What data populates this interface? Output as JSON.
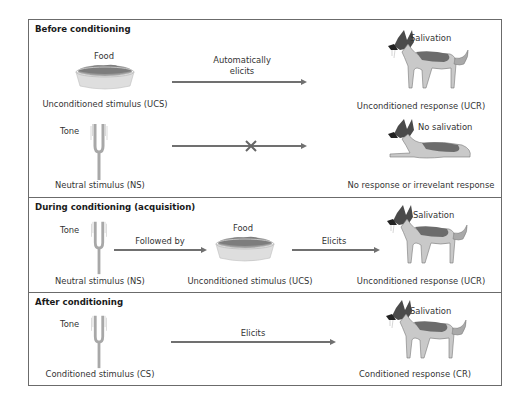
{
  "sections": [
    {
      "title": "Before conditioning",
      "rows": [
        {
          "stimulus_icon": "food-bowl-icon",
          "stimulus_caption": "Food",
          "stimulus_label": "Unconditioned stimulus (UCS)",
          "arrow_label_line1": "Automatically",
          "arrow_label_line2": "elicits",
          "response_icon": "standing-dog-salivating-icon",
          "response_caption": "Salivation",
          "response_label": "Unconditioned response (UCR)"
        },
        {
          "stimulus_icon": "tuning-fork-icon",
          "stimulus_caption": "Tone",
          "stimulus_label": "Neutral stimulus (NS)",
          "arrow_marker": "x-mark-icon",
          "response_icon": "lying-dog-icon",
          "response_caption": "No salivation",
          "response_label": "No response or irrevelant response"
        }
      ]
    },
    {
      "title": "During conditioning (acquisition)",
      "stimulus1_icon": "tuning-fork-icon",
      "stimulus1_caption": "Tone",
      "stimulus1_label": "Neutral stimulus (NS)",
      "arrow1_label": "Followed by",
      "stimulus2_icon": "food-bowl-icon",
      "stimulus2_caption": "Food",
      "stimulus2_label": "Unconditioned stimulus (UCS)",
      "arrow2_label": "Elicits",
      "response_icon": "standing-dog-salivating-icon",
      "response_caption": "Salivation",
      "response_label": "Unconditioned response (UCR)"
    },
    {
      "title": "After conditioning",
      "stimulus_icon": "tuning-fork-icon",
      "stimulus_caption": "Tone",
      "stimulus_label": "Conditioned stimulus (CS)",
      "arrow_label": "Elicits",
      "response_icon": "standing-dog-salivating-icon",
      "response_caption": "Salivation",
      "response_label": "Conditioned response (CR)"
    }
  ],
  "colors": {
    "border": "#6b6b6b",
    "arrow": "#707070",
    "dog_dark": "#3a3a3a",
    "dog_tan": "#c8c8c8",
    "bowl": "#dcdcdc"
  }
}
